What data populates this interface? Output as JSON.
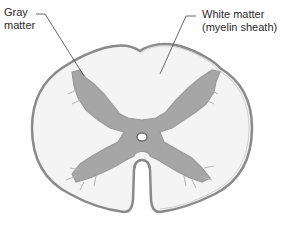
{
  "diagram": {
    "labels": {
      "gray_matter_line1": "Gray",
      "gray_matter_line2": "matter",
      "white_matter_line1": "White matter",
      "white_matter_line2": "(myelin sheath)"
    },
    "colors": {
      "gray_matter": "#a6a6a6",
      "white_matter": "#f4f4f4",
      "outline": "#8a8a8a",
      "leader_line": "#444444"
    }
  }
}
